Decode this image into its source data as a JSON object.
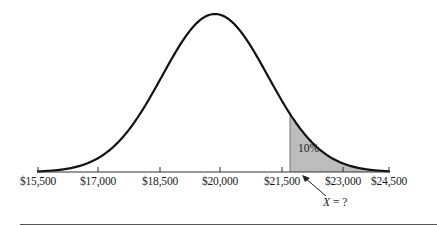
{
  "chart_data": {
    "type": "area",
    "title": "",
    "xlabel": "",
    "ylabel": "",
    "distribution": "normal",
    "x_ticks": [
      "$15,500",
      "$17,000",
      "$18,500",
      "$20,000",
      "$21,500",
      "$23,000",
      "$24,500"
    ],
    "x_tick_values": [
      15500,
      17000,
      18500,
      20000,
      21500,
      23000,
      24500
    ],
    "xlim": [
      15500,
      24500
    ],
    "grid": false,
    "legend": null,
    "shaded_region": {
      "from": "X",
      "to": 24500,
      "area_label": "10%",
      "fill_color": "#bdbdbd"
    },
    "annotations": [
      {
        "text": "10%",
        "target": "shaded upper tail"
      },
      {
        "text": "X = ?",
        "target": "left boundary of shaded region",
        "arrow": true
      }
    ]
  },
  "labels": {
    "tail_percent": "10%",
    "x_var": "X",
    "x_rest": " = ?"
  },
  "colors": {
    "curve": "#111111",
    "axis": "#333333",
    "shade": "#bdbdbd",
    "separator": "#555555"
  }
}
